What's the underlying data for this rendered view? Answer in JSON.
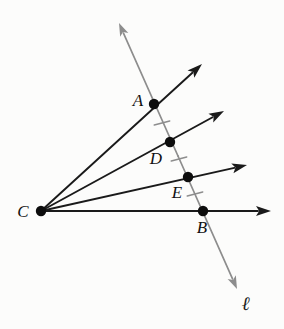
{
  "figure": {
    "kind": "geometry-diagram",
    "width": 284,
    "height": 329,
    "background_color": "#fcfcfb"
  },
  "colors": {
    "ray_stroke": "#1a1a1a",
    "transversal_stroke": "#8d8d8d",
    "point_fill": "#0d0d0d",
    "tick_stroke": "#8d8d8d",
    "label_color": "#111111"
  },
  "strokes": {
    "ray_width": 1.9,
    "transversal_width": 1.7,
    "tick_width": 1.5,
    "point_radius": 5.2
  },
  "vertex": {
    "name": "C",
    "label": "C",
    "x": 41,
    "y": 211,
    "label_x": 23,
    "label_y": 211
  },
  "points": [
    {
      "name": "A",
      "label": "A",
      "x": 154,
      "y": 104,
      "label_x": 138,
      "label_y": 100
    },
    {
      "name": "D",
      "label": "D",
      "x": 170,
      "y": 142,
      "label_x": 156,
      "label_y": 158
    },
    {
      "name": "E",
      "label": "E",
      "x": 188,
      "y": 177,
      "label_x": 177,
      "label_y": 192
    },
    {
      "name": "B",
      "label": "B",
      "x": 203,
      "y": 211,
      "label_x": 202,
      "label_y": 227
    }
  ],
  "rays": [
    {
      "name": "ray-CA",
      "through": "A",
      "from_x": 41,
      "from_y": 211,
      "tip_x": 202,
      "tip_y": 64
    },
    {
      "name": "ray-CD",
      "through": "D",
      "from_x": 41,
      "from_y": 211,
      "tip_x": 224,
      "tip_y": 111
    },
    {
      "name": "ray-CE",
      "through": "E",
      "from_x": 41,
      "from_y": 211,
      "tip_x": 247,
      "tip_y": 165
    },
    {
      "name": "ray-CB",
      "through": "B",
      "from_x": 41,
      "from_y": 211,
      "tip_x": 271,
      "tip_y": 211
    }
  ],
  "transversal": {
    "name": "line-l",
    "label": "ℓ",
    "top_tip_x": 119,
    "top_tip_y": 23,
    "bottom_tip_x": 237,
    "bottom_tip_y": 289,
    "label_x": 246,
    "label_y": 303
  },
  "tick_marks": [
    {
      "name": "tick-AD",
      "between": "A-D",
      "x": 162,
      "y": 123
    },
    {
      "name": "tick-DE",
      "between": "D-E",
      "x": 179,
      "y": 159
    },
    {
      "name": "tick-EB",
      "between": "E-B",
      "x": 195,
      "y": 194
    }
  ],
  "tick_geometry": {
    "half_length": 8,
    "angle_deg": -15
  },
  "arrowheads": {
    "ray_length": 15,
    "ray_half_width": 5,
    "transversal_length": 13,
    "transversal_half_width": 4.5
  }
}
